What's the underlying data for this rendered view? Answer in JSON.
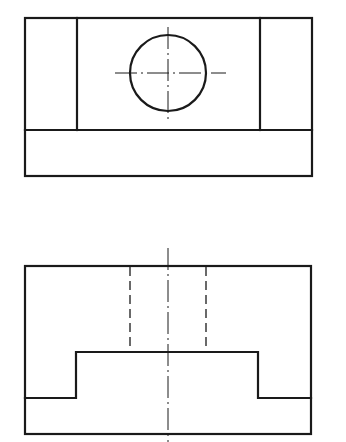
{
  "drawing": {
    "type": "orthographic-projection",
    "views": [
      {
        "name": "top-view",
        "outline_box": {
          "x1": 25,
          "y1": 18,
          "x2": 312,
          "y2": 176
        },
        "inner_verticals_x": [
          77,
          260
        ],
        "divider_y": 130,
        "hole": {
          "cx": 168,
          "cy": 73,
          "r": 38
        },
        "centerlines": {
          "horizontal": {
            "x1": 115,
            "x2": 226,
            "y": 73
          },
          "vertical": {
            "x": 168,
            "y1": 27,
            "y2": 119
          }
        }
      },
      {
        "name": "front-view",
        "outline_box": {
          "x1": 25,
          "y1": 266,
          "x2": 311,
          "y2": 434
        },
        "step_profile": {
          "step_top_y": 352,
          "step_left_x": 76,
          "step_right_x": 258,
          "ledge_y": 398
        },
        "hidden_lines_x": [
          130,
          206
        ],
        "centerline": {
          "x": 168,
          "y1": 248,
          "y2": 442
        }
      }
    ],
    "colors": {
      "line": "#1a1a1a",
      "background": "#ffffff"
    }
  }
}
